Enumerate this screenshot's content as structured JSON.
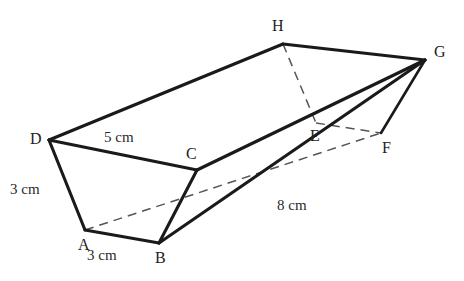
{
  "figure": {
    "type": "geometry-diagram",
    "background_color": "#ffffff",
    "stroke_color": "#1a1a1a",
    "hidden_edge_color": "#555555"
  },
  "vertices": [
    {
      "name": "A",
      "label": "A",
      "x": 85,
      "y": 230,
      "label_x": 78,
      "label_y": 237
    },
    {
      "name": "B",
      "label": "B",
      "x": 159,
      "y": 243,
      "label_x": 155,
      "label_y": 250
    },
    {
      "name": "C",
      "label": "C",
      "x": 197,
      "y": 170,
      "label_x": 186,
      "label_y": 146
    },
    {
      "name": "D",
      "label": "D",
      "x": 49,
      "y": 140,
      "label_x": 30,
      "label_y": 131
    },
    {
      "name": "E",
      "label": "E",
      "x": 316,
      "y": 123,
      "label_x": 310,
      "label_y": 128
    },
    {
      "name": "F",
      "label": "F",
      "x": 381,
      "y": 133,
      "label_x": 382,
      "label_y": 140
    },
    {
      "name": "G",
      "label": "G",
      "x": 425,
      "y": 60,
      "label_x": 434,
      "label_y": 44
    },
    {
      "name": "H",
      "label": "H",
      "x": 283,
      "y": 44,
      "label_x": 272,
      "label_y": 18
    }
  ],
  "edges_solid": [
    {
      "name": "edge-D-H",
      "from": "D",
      "to": "H"
    },
    {
      "name": "edge-H-G",
      "from": "H",
      "to": "G"
    },
    {
      "name": "edge-D-C",
      "from": "D",
      "to": "C"
    },
    {
      "name": "edge-C-G",
      "from": "C",
      "to": "G"
    },
    {
      "name": "edge-D-A",
      "from": "D",
      "to": "A"
    },
    {
      "name": "edge-A-B",
      "from": "A",
      "to": "B"
    },
    {
      "name": "edge-C-B",
      "from": "C",
      "to": "B"
    },
    {
      "name": "edge-B-G",
      "from": "B",
      "to": "G"
    },
    {
      "name": "edge-F-G",
      "from": "F",
      "to": "G"
    }
  ],
  "edges_hidden": [
    {
      "name": "edge-A-E-F",
      "from": "A",
      "to": "F",
      "note": "dashed through E"
    },
    {
      "name": "edge-H-E",
      "from": "H",
      "to": "E"
    },
    {
      "name": "edge-E-F",
      "from": "E",
      "to": "F"
    }
  ],
  "measurements": [
    {
      "name": "length-DC",
      "text": "5 cm",
      "x": 104,
      "y": 130,
      "edge": "D-C"
    },
    {
      "name": "length-DA",
      "text": "3 cm",
      "x": 10,
      "y": 182,
      "edge": "D-A"
    },
    {
      "name": "length-AB",
      "text": "3 cm",
      "x": 87,
      "y": 248,
      "edge": "A-B"
    },
    {
      "name": "length-BG",
      "text": "8 cm",
      "x": 277,
      "y": 198,
      "edge": "B-G"
    }
  ]
}
